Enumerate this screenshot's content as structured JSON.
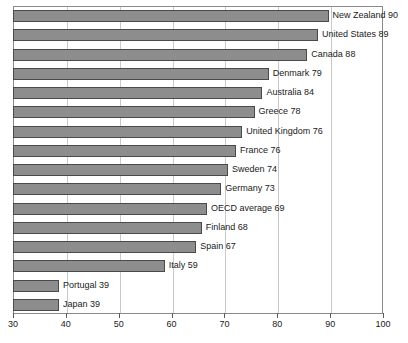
{
  "chart_data": {
    "type": "bar",
    "orientation": "horizontal",
    "title": "",
    "subtitle": "",
    "xlabel": "",
    "ylabel": "",
    "xlim": [
      30,
      100
    ],
    "xticks": [
      30,
      40,
      50,
      60,
      70,
      80,
      90,
      100
    ],
    "xtick_labels": [
      "30",
      "40",
      "50",
      "60",
      "70",
      "80",
      "90",
      "100"
    ],
    "grid": true,
    "grid_axis": "x",
    "legend": false,
    "legend_position": "none",
    "bar_fill_color": "#8d8d8d",
    "bar_edge_color": "#4a4a4a",
    "gridline_color": "#c9c9c9",
    "axis_color": "#8a8a8a",
    "categories": [
      "New Zealand",
      "United States",
      "Canada",
      "Denmark",
      "Australia",
      "Greece",
      "United Kingdom",
      "France",
      "Sweden",
      "Germany",
      "OECD average",
      "Finland",
      "Spain",
      "Italy",
      "Portugal",
      "Japan"
    ],
    "values": [
      90,
      89,
      88,
      79,
      84,
      78,
      76,
      76,
      74,
      73,
      69,
      68,
      67,
      59,
      39,
      39
    ],
    "bar_lengths": [
      89.5,
      87.5,
      85.5,
      78.2,
      77.0,
      75.5,
      73.2,
      72.0,
      70.5,
      69.2,
      66.5,
      65.5,
      64.5,
      58.5,
      38.5,
      38.5
    ],
    "data_labels": [
      "New Zealand 90",
      "United States 89",
      "Canada 88",
      "Denmark 79",
      "Australia 84",
      "Greece 78",
      "United Kingdom 76",
      "France 76",
      "Sweden 74",
      "Germany 73",
      "OECD average 69",
      "Finland 68",
      "Spain 67",
      "Italy 59",
      "Portugal 39",
      "Japan 39"
    ]
  }
}
